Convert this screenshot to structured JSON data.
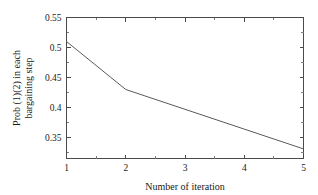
{
  "chart_data": {
    "type": "line",
    "title": "",
    "subtitle": "",
    "xlabel": "Number of iteration",
    "ylabel": "Prob (1)(2) in each bargaining step",
    "ylabel_lines": [
      "Prob (1)(2) in each",
      "bargaining step"
    ],
    "x": [
      1,
      2,
      3,
      4,
      5
    ],
    "series": [
      {
        "name": "Prob (1)(2)",
        "values": [
          0.51,
          0.43,
          0.397,
          0.364,
          0.331
        ],
        "color": "#5a5a5a"
      }
    ],
    "xlim": [
      1,
      5
    ],
    "ylim": [
      0.315,
      0.55
    ],
    "xticks": [
      1,
      2,
      3,
      4,
      5
    ],
    "xtick_labels": [
      "1",
      "2",
      "3",
      "4",
      "5"
    ],
    "xticks_minor": [
      1.5,
      2.5,
      3.5,
      4.5
    ],
    "yticks": [
      0.35,
      0.4,
      0.45,
      0.5,
      0.55
    ],
    "ytick_labels": [
      "0.35",
      "0.4",
      "0.45",
      "0.5",
      "0.55"
    ],
    "yticks_minor": [
      0.325,
      0.375,
      0.425,
      0.475,
      0.525
    ],
    "grid": false,
    "legend": false,
    "legend_position": "none",
    "frame": "box",
    "tick_direction": "in",
    "axis_color": "#4a4a4a",
    "background_color": "#ffffff"
  }
}
